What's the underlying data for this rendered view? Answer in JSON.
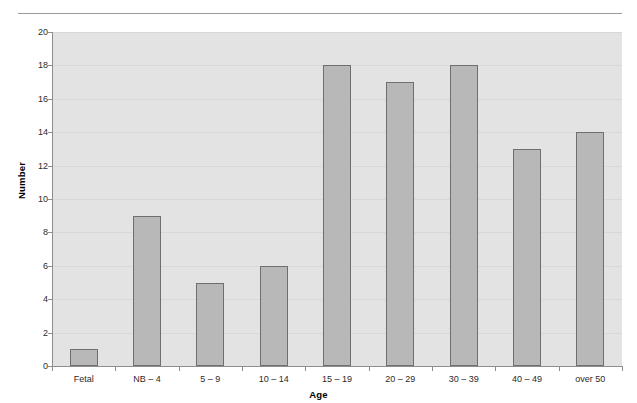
{
  "page": {
    "top_fragment": "",
    "background": "#ffffff"
  },
  "chart_data": {
    "type": "bar",
    "title": "",
    "xlabel": "Age",
    "ylabel": "Number",
    "categories": [
      "Fetal",
      "NB –  4",
      "5 – 9",
      "10 – 14",
      "15 – 19",
      "20 – 29",
      "30 – 39",
      "40 – 49",
      "over 50"
    ],
    "values": [
      1,
      9,
      5,
      6,
      18,
      17,
      18,
      13,
      14
    ],
    "ylim": [
      0,
      20
    ],
    "ytick_step": 2,
    "ytick_labels": [
      "0",
      "2",
      "4",
      "6",
      "8",
      "10",
      "12",
      "14",
      "16",
      "18",
      "20"
    ],
    "grid": true,
    "legend": false,
    "colors": {
      "bar_fill": "#b8b8b8",
      "bar_border": "#6f6f6f",
      "plot_background": "#e3e3e3",
      "gridline": "#d8d8d8",
      "axis": "#8e8e8e",
      "text": "#2b2b2b"
    }
  }
}
